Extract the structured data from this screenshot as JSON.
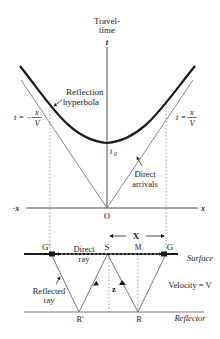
{
  "diagram": {
    "axis_labels": {
      "time_title_line1": "Travel-",
      "time_title_line2": "time",
      "t_axis": "t",
      "x_pos": "x",
      "x_neg": "-x",
      "origin": "O",
      "t0": "t",
      "t0_sub": "0"
    },
    "annotations": {
      "reflection_hyperbola_line1": "Reflection",
      "reflection_hyperbola_line2": "hyperbola",
      "direct_arrivals_line1": "Direct",
      "direct_arrivals_line2": "arrivals",
      "eq_left_prefix": "t = −",
      "eq_right_prefix": "t =",
      "eq_num": "x",
      "eq_den": "V"
    },
    "geometry": {
      "offset_label": "X",
      "points": {
        "g_prime": "G'",
        "s": "S",
        "m": "M",
        "g": "G",
        "r_prime": "R'",
        "r": "R"
      },
      "depth_label": "z",
      "direct_ray_line1": "Direct",
      "direct_ray_line2": "ray",
      "reflected_ray_line1": "Reflected",
      "reflected_ray_line2": "ray",
      "surface_label": "Surface",
      "reflector_label": "Reflector",
      "velocity_label": "Velocity = V"
    },
    "colors": {
      "ink": "#1a1a1a",
      "thin_line": "#6a6a6a",
      "dotted": "#8a8a8a"
    }
  }
}
